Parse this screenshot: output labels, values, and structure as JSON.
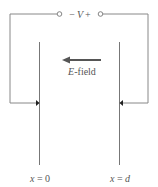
{
  "diagram": {
    "type": "parallel-plate capacitor circuit",
    "source": {
      "minus": "−",
      "symbol": "V",
      "plus": "+"
    },
    "field": {
      "label_var": "E",
      "label_rest": "-field",
      "direction": "left"
    },
    "plates": [
      {
        "var": "x",
        "eq": " = ",
        "val": "0"
      },
      {
        "var": "x",
        "eq": " = ",
        "val": "d"
      }
    ],
    "colors": {
      "line": "#777777",
      "arrow": "#555555",
      "text": "#555555"
    }
  }
}
